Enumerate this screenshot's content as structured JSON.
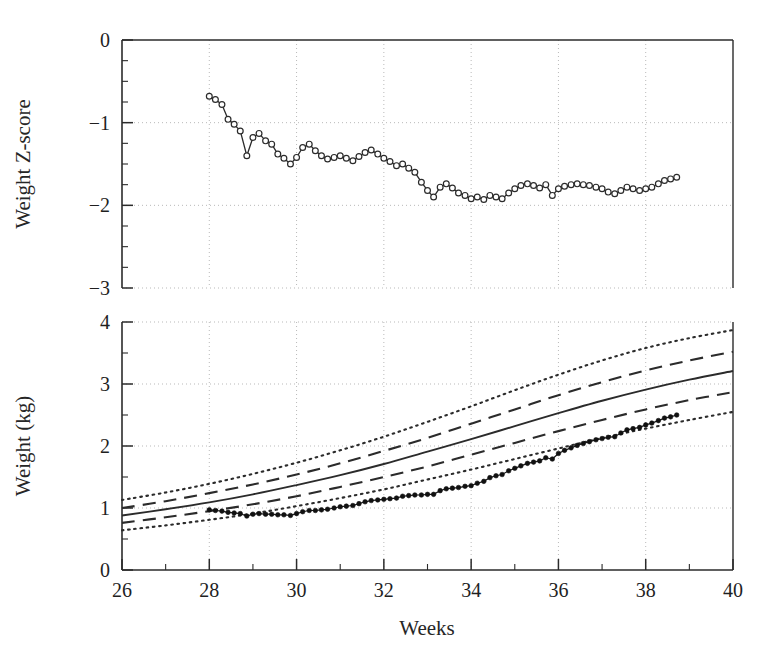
{
  "figure": {
    "background": "#ffffff",
    "ink": "#2b2b2b",
    "grid_color": "#b9b9b9"
  },
  "chart_data": [
    {
      "type": "line",
      "panel": "top",
      "title": "",
      "xlabel": "",
      "ylabel": "Weight Z-score",
      "xlim": [
        26,
        40
      ],
      "ylim": [
        -3,
        0
      ],
      "xticks": [
        26,
        28,
        30,
        32,
        34,
        36,
        38,
        40
      ],
      "yticks": [
        0,
        -1,
        -2,
        -3
      ],
      "ytick_labels": [
        "0",
        "−1",
        "−2",
        "−3"
      ],
      "minor_x_step": 1,
      "minor_y_step": 0.25,
      "grid": true,
      "grid_style": "dotted",
      "legend": "none",
      "marker": "open-circle",
      "series": [
        {
          "name": "Weight Z-score",
          "x": [
            28.0,
            28.14,
            28.29,
            28.43,
            28.57,
            28.71,
            28.86,
            29.0,
            29.14,
            29.29,
            29.43,
            29.57,
            29.71,
            29.86,
            30.0,
            30.14,
            30.29,
            30.43,
            30.57,
            30.71,
            30.86,
            31.0,
            31.14,
            31.29,
            31.43,
            31.57,
            31.71,
            31.86,
            32.0,
            32.14,
            32.29,
            32.43,
            32.57,
            32.71,
            32.86,
            33.0,
            33.14,
            33.29,
            33.43,
            33.57,
            33.71,
            33.86,
            34.0,
            34.14,
            34.29,
            34.43,
            34.57,
            34.71,
            34.86,
            35.0,
            35.14,
            35.29,
            35.43,
            35.57,
            35.71,
            35.86,
            36.0,
            36.14,
            36.29,
            36.43,
            36.57,
            36.71,
            36.86,
            37.0,
            37.14,
            37.29,
            37.43,
            37.57,
            37.71,
            37.86,
            38.0,
            38.14,
            38.29,
            38.43,
            38.57,
            38.71
          ],
          "y": [
            -0.68,
            -0.72,
            -0.78,
            -0.96,
            -1.02,
            -1.1,
            -1.4,
            -1.18,
            -1.13,
            -1.22,
            -1.26,
            -1.38,
            -1.43,
            -1.5,
            -1.42,
            -1.3,
            -1.26,
            -1.34,
            -1.4,
            -1.44,
            -1.42,
            -1.4,
            -1.43,
            -1.46,
            -1.41,
            -1.36,
            -1.33,
            -1.38,
            -1.43,
            -1.47,
            -1.52,
            -1.5,
            -1.55,
            -1.6,
            -1.72,
            -1.82,
            -1.9,
            -1.78,
            -1.74,
            -1.79,
            -1.85,
            -1.88,
            -1.92,
            -1.9,
            -1.93,
            -1.88,
            -1.9,
            -1.92,
            -1.85,
            -1.8,
            -1.76,
            -1.74,
            -1.76,
            -1.79,
            -1.75,
            -1.88,
            -1.8,
            -1.77,
            -1.75,
            -1.74,
            -1.75,
            -1.76,
            -1.78,
            -1.8,
            -1.84,
            -1.86,
            -1.82,
            -1.78,
            -1.8,
            -1.82,
            -1.8,
            -1.78,
            -1.74,
            -1.7,
            -1.68,
            -1.66
          ]
        }
      ]
    },
    {
      "type": "line",
      "panel": "bottom",
      "title": "",
      "xlabel": "Weeks",
      "ylabel": "Weight (kg)",
      "xlim": [
        26,
        40
      ],
      "ylim": [
        0,
        4
      ],
      "xticks": [
        26,
        28,
        30,
        32,
        34,
        36,
        38,
        40
      ],
      "xtick_labels": [
        "26",
        "28",
        "30",
        "32",
        "34",
        "36",
        "38",
        "40"
      ],
      "yticks": [
        0,
        1,
        2,
        3,
        4
      ],
      "ytick_labels": [
        "0",
        "1",
        "2",
        "3",
        "4"
      ],
      "minor_x_step": 1,
      "minor_y_step": 0.5,
      "grid": true,
      "grid_style": "dotted",
      "legend": "none",
      "marker": "filled-circle",
      "reference_x": [
        26,
        27,
        28,
        29,
        30,
        31,
        32,
        33,
        34,
        35,
        36,
        37,
        38,
        39,
        40
      ],
      "series": [
        {
          "name": "upper-outer-percentile",
          "style": "dotted",
          "values": [
            1.13,
            1.25,
            1.39,
            1.55,
            1.73,
            1.93,
            2.15,
            2.39,
            2.64,
            2.9,
            3.15,
            3.38,
            3.58,
            3.74,
            3.87
          ]
        },
        {
          "name": "upper-inner-percentile",
          "style": "dashed",
          "values": [
            1.0,
            1.11,
            1.24,
            1.38,
            1.54,
            1.72,
            1.92,
            2.13,
            2.36,
            2.59,
            2.82,
            3.03,
            3.22,
            3.38,
            3.52
          ]
        },
        {
          "name": "median-percentile",
          "style": "solid",
          "values": [
            0.88,
            0.98,
            1.09,
            1.22,
            1.37,
            1.53,
            1.71,
            1.91,
            2.11,
            2.32,
            2.53,
            2.73,
            2.91,
            3.07,
            3.21
          ]
        },
        {
          "name": "lower-inner-percentile",
          "style": "dashed",
          "values": [
            0.76,
            0.85,
            0.95,
            1.06,
            1.19,
            1.34,
            1.5,
            1.67,
            1.86,
            2.05,
            2.24,
            2.42,
            2.59,
            2.74,
            2.87
          ]
        },
        {
          "name": "lower-outer-percentile",
          "style": "dotted",
          "values": [
            0.64,
            0.72,
            0.81,
            0.91,
            1.03,
            1.16,
            1.3,
            1.46,
            1.62,
            1.79,
            1.96,
            2.13,
            2.28,
            2.42,
            2.55
          ]
        },
        {
          "name": "patient-weight",
          "style": "markers",
          "x": [
            28.0,
            28.14,
            28.29,
            28.43,
            28.57,
            28.71,
            28.86,
            29.0,
            29.14,
            29.29,
            29.43,
            29.57,
            29.71,
            29.86,
            30.0,
            30.14,
            30.29,
            30.43,
            30.57,
            30.71,
            30.86,
            31.0,
            31.14,
            31.29,
            31.43,
            31.57,
            31.71,
            31.86,
            32.0,
            32.14,
            32.29,
            32.43,
            32.57,
            32.71,
            32.86,
            33.0,
            33.14,
            33.29,
            33.43,
            33.57,
            33.71,
            33.86,
            34.0,
            34.14,
            34.29,
            34.43,
            34.57,
            34.71,
            34.86,
            35.0,
            35.14,
            35.29,
            35.43,
            35.57,
            35.71,
            35.86,
            36.0,
            36.14,
            36.29,
            36.43,
            36.57,
            36.71,
            36.86,
            37.0,
            37.14,
            37.29,
            37.43,
            37.57,
            37.71,
            37.86,
            38.0,
            38.14,
            38.29,
            38.43,
            38.57,
            38.71
          ],
          "values": [
            0.97,
            0.96,
            0.95,
            0.93,
            0.92,
            0.91,
            0.87,
            0.9,
            0.91,
            0.9,
            0.9,
            0.89,
            0.89,
            0.88,
            0.91,
            0.94,
            0.96,
            0.96,
            0.97,
            0.98,
            1.0,
            1.02,
            1.03,
            1.04,
            1.07,
            1.1,
            1.12,
            1.13,
            1.14,
            1.15,
            1.16,
            1.19,
            1.2,
            1.21,
            1.21,
            1.22,
            1.22,
            1.28,
            1.31,
            1.32,
            1.33,
            1.35,
            1.36,
            1.4,
            1.43,
            1.49,
            1.52,
            1.54,
            1.6,
            1.64,
            1.68,
            1.72,
            1.74,
            1.76,
            1.81,
            1.79,
            1.88,
            1.93,
            1.97,
            2.01,
            2.04,
            2.07,
            2.1,
            2.12,
            2.14,
            2.15,
            2.21,
            2.26,
            2.28,
            2.3,
            2.34,
            2.37,
            2.41,
            2.45,
            2.47,
            2.5
          ]
        }
      ]
    }
  ]
}
